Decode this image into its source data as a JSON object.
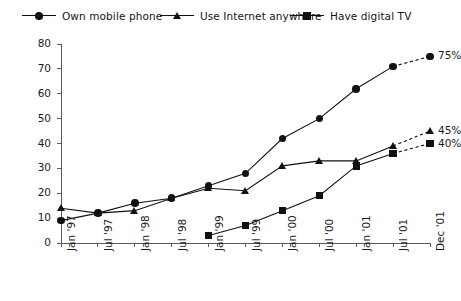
{
  "chart_data": {
    "type": "line",
    "title": "",
    "xlabel": "",
    "ylabel": "",
    "ylim": [
      0,
      80
    ],
    "ytick_step": 10,
    "grid": false,
    "legend_position": "top",
    "categories": [
      "Jan '97",
      "Jul '97",
      "Jan '98",
      "Jul '98",
      "Jan '99",
      "Jul '99",
      "Jan '00",
      "Jul '00",
      "Jan '01",
      "Jul '01",
      "Dec '01"
    ],
    "ytick_labels": [
      "0",
      "10",
      "20",
      "30",
      "40",
      "50",
      "60",
      "70",
      "80"
    ],
    "series": [
      {
        "name": "Own mobile phone",
        "marker": "circle",
        "values": [
          9,
          12,
          16,
          18,
          23,
          28,
          42,
          50,
          62,
          71,
          75
        ],
        "projected_from_index": 9,
        "endpoint_label": "75%"
      },
      {
        "name": "Use Internet anywhere",
        "marker": "triangle",
        "values": [
          14,
          12,
          13,
          18,
          22,
          21,
          31,
          33,
          33,
          39,
          45
        ],
        "projected_from_index": 9,
        "endpoint_label": "45%"
      },
      {
        "name": "Have digital TV",
        "marker": "square",
        "values": [
          null,
          null,
          null,
          null,
          3,
          7,
          13,
          19,
          31,
          36,
          40
        ],
        "projected_from_index": 9,
        "endpoint_label": "40%"
      }
    ]
  },
  "legend": {
    "items": [
      {
        "label": "Own mobile phone",
        "marker": "circle"
      },
      {
        "label": "Use Internet anywhere",
        "marker": "triangle"
      },
      {
        "label": "Have digital TV",
        "marker": "square"
      }
    ]
  },
  "colors": {
    "ink": "#111111",
    "axis": "#5b5b5b",
    "background": "#ffffff"
  }
}
